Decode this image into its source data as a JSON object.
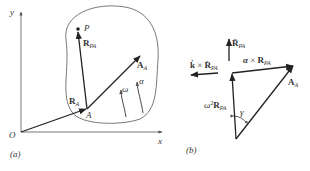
{
  "figure_a": {
    "caption": "(a)",
    "axes": {
      "x_label": "x",
      "y_label": "y",
      "origin_label": "O"
    },
    "points": {
      "P": "P",
      "A": "A"
    },
    "vectors": {
      "R_A": {
        "main": "R",
        "sub": "A"
      },
      "R_PA": {
        "main": "R",
        "sub": "PA"
      },
      "A_A": {
        "main": "A",
        "sub": "A"
      }
    },
    "rotation": {
      "omega": "ω",
      "alpha": "α"
    }
  },
  "figure_b": {
    "caption": "(b)",
    "vectors": {
      "R_PA_ddot": {
        "main": "R̈",
        "sub": "PA"
      },
      "k_cross": {
        "k": "k̇",
        "times": " × ",
        "main": "Ṙ",
        "sub": "PA"
      },
      "alpha_cross": {
        "alpha": "α",
        "times": " × ",
        "main": "R",
        "sub": "PA"
      },
      "omega2": {
        "omega": "ω",
        "sup": "2",
        "main": "R",
        "sub": "PA"
      },
      "A_A": {
        "main": "A",
        "sub": "A"
      }
    },
    "angle": "γ"
  }
}
